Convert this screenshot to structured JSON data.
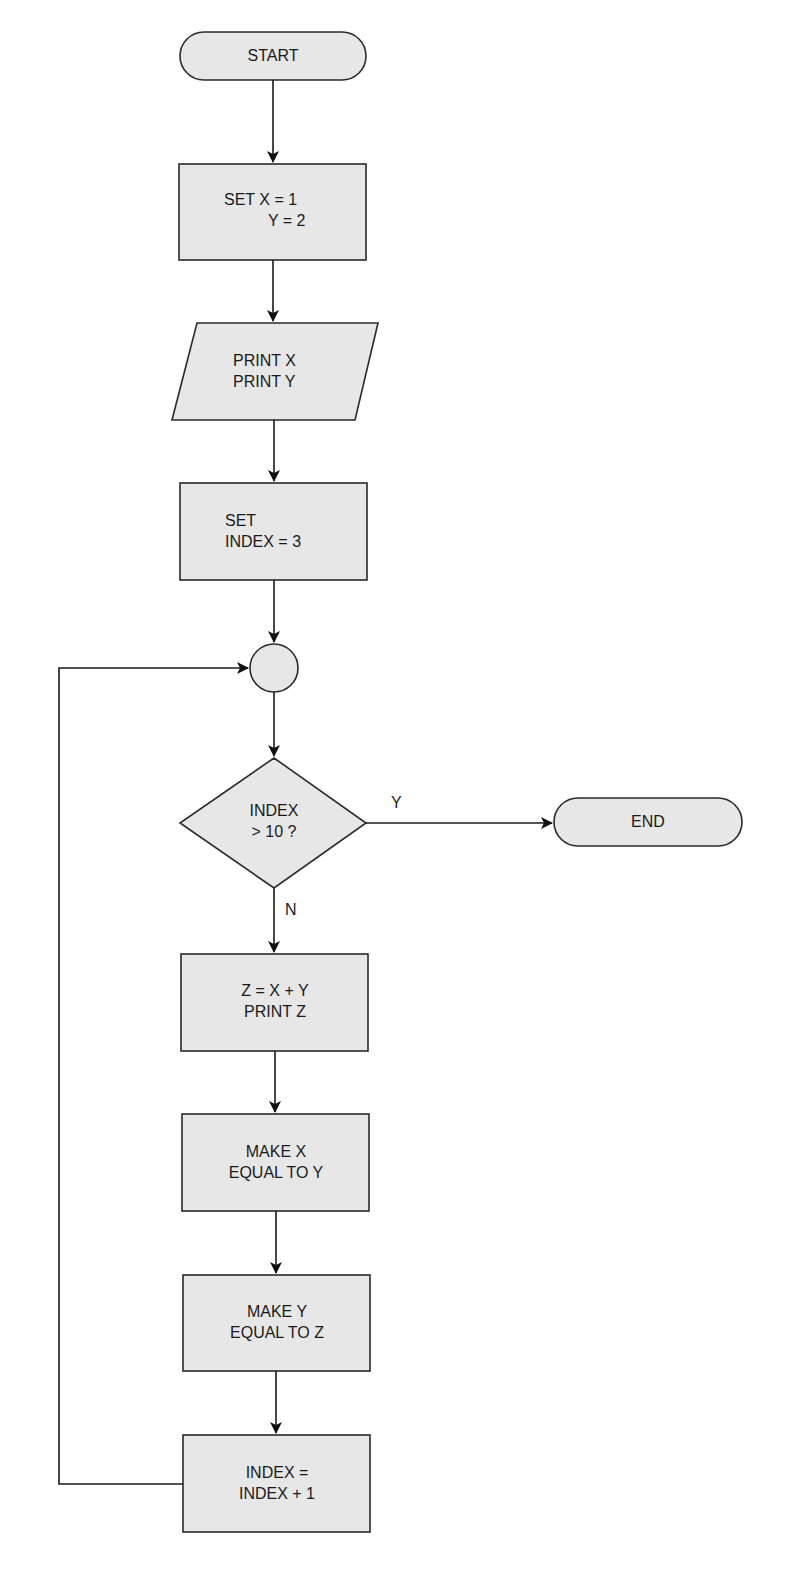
{
  "flowchart": {
    "start": {
      "label": "START"
    },
    "init": {
      "line1": "SET X = 1",
      "line2": "Y = 2"
    },
    "print_xy": {
      "line1": "PRINT X",
      "line2": "PRINT Y"
    },
    "set_index": {
      "line1": "SET",
      "line2": "INDEX = 3"
    },
    "decision": {
      "line1": "INDEX",
      "line2": "> 10 ?",
      "yes_label": "Y",
      "no_label": "N"
    },
    "end": {
      "label": "END"
    },
    "compute_z": {
      "line1": "Z = X + Y",
      "line2": "PRINT Z"
    },
    "make_x": {
      "line1": "MAKE X",
      "line2": "EQUAL TO Y"
    },
    "make_y": {
      "line1": "MAKE Y",
      "line2": "EQUAL TO Z"
    },
    "increment": {
      "line1": "INDEX =",
      "line2": "INDEX + 1"
    }
  },
  "colors": {
    "fill": "#e7e7e7",
    "stroke": "#2a2a2a"
  }
}
